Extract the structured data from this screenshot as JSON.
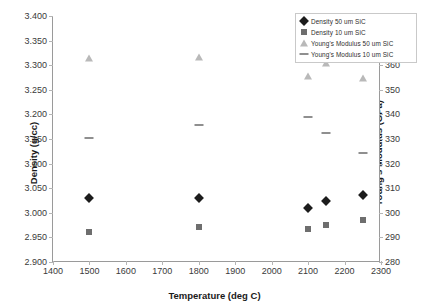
{
  "chart_data": {
    "type": "scatter",
    "title": "",
    "xlabel": "Temperature (deg C)",
    "ylabel": "Density (g/cc)",
    "y2label": "Young's Modulus (GPa)",
    "xlim": [
      1400,
      2300
    ],
    "ylim": [
      2.9,
      3.4
    ],
    "y2lim": [
      280,
      380
    ],
    "grid": false,
    "legend_position": "top-right",
    "xticks": [
      "1400",
      "1500",
      "1600",
      "1700",
      "1800",
      "1900",
      "2000",
      "2100",
      "2200",
      "2300"
    ],
    "xtick_values": [
      1400,
      1500,
      1600,
      1700,
      1800,
      1900,
      2000,
      2100,
      2200,
      2300
    ],
    "yticks": [
      "2.900",
      "2.950",
      "3.000",
      "3.050",
      "3.100",
      "3.150",
      "3.200",
      "3.250",
      "3.300",
      "3.350",
      "3.400"
    ],
    "ytick_values": [
      2.9,
      2.95,
      3.0,
      3.05,
      3.1,
      3.15,
      3.2,
      3.25,
      3.3,
      3.35,
      3.4
    ],
    "y2ticks": [
      "280",
      "290",
      "300",
      "310",
      "320",
      "330",
      "340",
      "350",
      "360",
      "370",
      "380"
    ],
    "y2tick_values": [
      280,
      290,
      300,
      310,
      320,
      330,
      340,
      350,
      360,
      370,
      380
    ],
    "series": [
      {
        "name": "Density 50 um SiC",
        "marker": "diamond",
        "color": "#1c1c1c",
        "axis": "left",
        "points": [
          {
            "x": 1500,
            "y": 3.03
          },
          {
            "x": 1800,
            "y": 3.03
          },
          {
            "x": 2100,
            "y": 3.01
          },
          {
            "x": 2150,
            "y": 3.023
          },
          {
            "x": 2250,
            "y": 3.036
          }
        ]
      },
      {
        "name": "Density 10 um SiC",
        "marker": "square",
        "color": "#6e6e6e",
        "axis": "left",
        "points": [
          {
            "x": 1500,
            "y": 2.96
          },
          {
            "x": 1800,
            "y": 2.972
          },
          {
            "x": 2100,
            "y": 2.968
          },
          {
            "x": 2150,
            "y": 2.976
          },
          {
            "x": 2250,
            "y": 2.986
          }
        ]
      },
      {
        "name": "Young's Modulus 50 um SiC",
        "marker": "triangle",
        "color": "#b9b9b9",
        "axis": "right",
        "points": [
          {
            "x": 1500,
            "y": 363
          },
          {
            "x": 1800,
            "y": 363.5
          },
          {
            "x": 2100,
            "y": 355.5
          },
          {
            "x": 2150,
            "y": 361
          },
          {
            "x": 2250,
            "y": 355
          }
        ]
      },
      {
        "name": "Young's Modulus 10 um SiC",
        "marker": "dash",
        "color": "#8f8f8f",
        "axis": "right",
        "points": [
          {
            "x": 1500,
            "y": 330.5
          },
          {
            "x": 1800,
            "y": 335.5
          },
          {
            "x": 2100,
            "y": 339
          },
          {
            "x": 2150,
            "y": 332.5
          },
          {
            "x": 2250,
            "y": 324.5
          }
        ]
      }
    ]
  }
}
